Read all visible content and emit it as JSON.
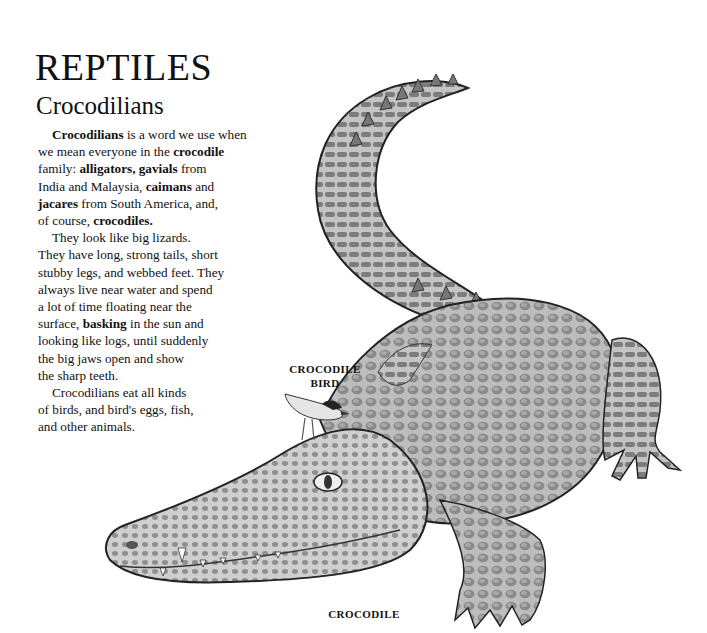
{
  "page": {
    "title": "REPTILES",
    "subtitle": "Crocodilians"
  },
  "paragraphs": [
    {
      "lines": [
        [
          {
            "t": "Crocodilians",
            "b": true
          },
          {
            "t": " is a word we use when",
            "b": false
          }
        ],
        [
          {
            "t": "we mean everyone in the ",
            "b": false
          },
          {
            "t": "crocodile",
            "b": true
          }
        ],
        [
          {
            "t": "family: ",
            "b": false
          },
          {
            "t": "alligators, gavials",
            "b": true
          },
          {
            "t": " from",
            "b": false
          }
        ],
        [
          {
            "t": "India and Malaysia, ",
            "b": false
          },
          {
            "t": "caimans",
            "b": true
          },
          {
            "t": " and",
            "b": false
          }
        ],
        [
          {
            "t": "jacares",
            "b": true
          },
          {
            "t": " from South America, and,",
            "b": false
          }
        ],
        [
          {
            "t": "of course, ",
            "b": false
          },
          {
            "t": "crocodiles.",
            "b": true
          }
        ]
      ]
    },
    {
      "lines": [
        [
          {
            "t": "They look like big lizards.",
            "b": false
          }
        ],
        [
          {
            "t": "They have long, strong tails, short",
            "b": false
          }
        ],
        [
          {
            "t": "stubby legs, and webbed feet. They",
            "b": false
          }
        ],
        [
          {
            "t": "always live near water and spend",
            "b": false
          }
        ],
        [
          {
            "t": "a lot of time floating near the",
            "b": false
          }
        ],
        [
          {
            "t": "surface, ",
            "b": false
          },
          {
            "t": "basking",
            "b": true
          },
          {
            "t": " in the sun and",
            "b": false
          }
        ],
        [
          {
            "t": "looking like logs, until suddenly",
            "b": false
          }
        ],
        [
          {
            "t": "the big jaws open and show",
            "b": false
          }
        ],
        [
          {
            "t": "the sharp teeth.",
            "b": false
          }
        ]
      ]
    },
    {
      "lines": [
        [
          {
            "t": "Crocodilians eat all kinds",
            "b": false
          }
        ],
        [
          {
            "t": "of birds, and bird's eggs, fish,",
            "b": false
          }
        ],
        [
          {
            "t": "and other animals.",
            "b": false
          }
        ]
      ]
    }
  ],
  "labels": {
    "bird_line1": "CROCODILE",
    "bird_line2": "BIRD",
    "crocodile": "CROCODILE"
  },
  "illustration": {
    "subject": "crocodile-with-crocodile-bird",
    "style": "grayscale pencil drawing"
  }
}
